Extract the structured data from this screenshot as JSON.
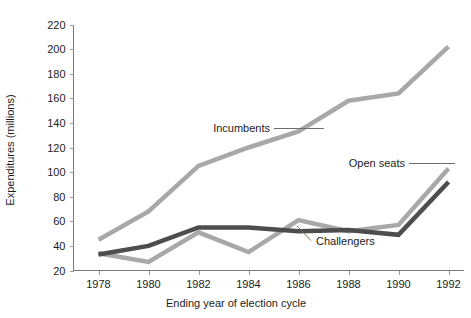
{
  "chart_data": {
    "type": "line",
    "title": "",
    "xlabel": "Ending year of election cycle",
    "ylabel": "Expenditures (millions)",
    "x": [
      1978,
      1980,
      1982,
      1984,
      1986,
      1988,
      1990,
      1992
    ],
    "xticklabels": [
      "1978",
      "1980",
      "1982",
      "1984",
      "1986",
      "1988",
      "1990",
      "1992"
    ],
    "xlim": [
      1977,
      1992.6
    ],
    "ylim": [
      20,
      220
    ],
    "yticks": [
      20,
      40,
      60,
      80,
      100,
      120,
      140,
      160,
      180,
      200,
      220
    ],
    "yticklabels": [
      "20",
      "40",
      "60",
      "80",
      "100",
      "120",
      "140",
      "160",
      "180",
      "200",
      "220"
    ],
    "grid": false,
    "legend_position": "inline-annotations",
    "series": [
      {
        "name": "Incumbents",
        "color": "#a8a8a8",
        "values": [
          45,
          68,
          105,
          120,
          133,
          158,
          164,
          202
        ]
      },
      {
        "name": "Open seats",
        "color": "#a8a8a8",
        "values": [
          34,
          27,
          51,
          35,
          61,
          52,
          57,
          103
        ]
      },
      {
        "name": "Challengers",
        "color": "#4d4d4d",
        "values": [
          33,
          40,
          55,
          55,
          52,
          53,
          49,
          92
        ]
      }
    ],
    "annotations": [
      {
        "text": "Incumbents",
        "series": "Incumbents"
      },
      {
        "text": "Open seats",
        "series": "Open seats"
      },
      {
        "text": "Challengers",
        "series": "Challengers"
      }
    ]
  },
  "colors": {
    "light_gray_series": "#a8a8a8",
    "dark_gray_series": "#4d4d4d",
    "axis": "#7a7a7a",
    "text": "#1c1c1c",
    "background": "#ffffff"
  }
}
